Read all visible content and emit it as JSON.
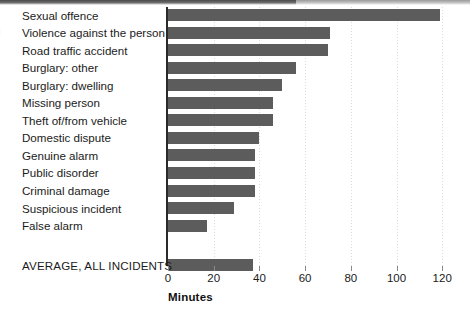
{
  "chart_data": {
    "type": "bar",
    "orientation": "horizontal",
    "title": "",
    "xlabel": "Minutes",
    "ylabel": "",
    "xlim": [
      0,
      120
    ],
    "xticks": [
      0,
      20,
      40,
      60,
      80,
      100,
      120
    ],
    "grid": true,
    "legend": false,
    "bar_color": "#5c5c5c",
    "axis_color": "#2b2b2b",
    "categories": [
      "Sexual offence",
      "Violence against the person",
      "Road traffic accident",
      "Burglary: other",
      "Burglary: dwelling",
      "Missing person",
      "Theft of/from vehicle",
      "Domestic dispute",
      "Genuine alarm",
      "Public disorder",
      "Criminal damage",
      "Suspicious incident",
      "False alarm",
      "AVERAGE, ALL INCIDENTS"
    ],
    "values": [
      119,
      71,
      70,
      56,
      50,
      46,
      46,
      40,
      38,
      38,
      38,
      29,
      17,
      37
    ],
    "separator_before_last": true
  },
  "axis": {
    "tick_labels": [
      "0",
      "20",
      "40",
      "60",
      "80",
      "100",
      "120"
    ],
    "title": "Minutes"
  },
  "artifacts": {
    "edge_glyph": "l"
  }
}
